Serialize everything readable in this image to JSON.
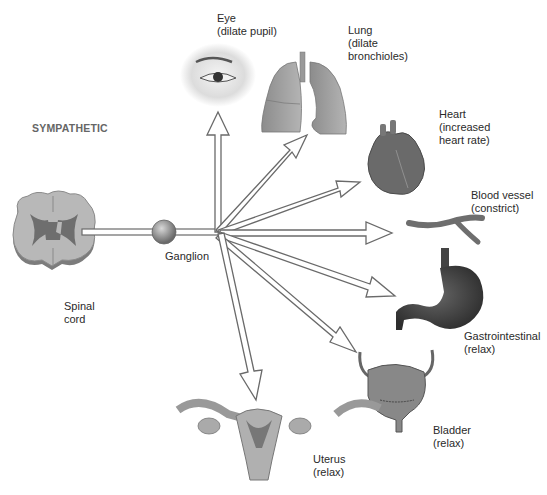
{
  "title": "SYMPATHETIC",
  "source": {
    "label": "Spinal\ncord"
  },
  "ganglion": {
    "label": "Ganglion"
  },
  "targets": [
    {
      "organ": "Eye",
      "effect": "(dilate pupil)",
      "label": "Eye\n(dilate pupil)"
    },
    {
      "organ": "Lung",
      "effect": "(dilate bronchioles)",
      "label": "Lung\n(dilate\nbronchioles)"
    },
    {
      "organ": "Heart",
      "effect": "(increased heart rate)",
      "label": "Heart\n(increased\nheart rate)"
    },
    {
      "organ": "Blood vessel",
      "effect": "(constrict)",
      "label": "Blood vessel\n(constrict)"
    },
    {
      "organ": "Gastrointestinal",
      "effect": "(relax)",
      "label": "Gastrointestinal\n(relax)"
    },
    {
      "organ": "Bladder",
      "effect": "(relax)",
      "label": "Bladder\n(relax)"
    },
    {
      "organ": "Uterus",
      "effect": "(relax)",
      "label": "Uterus\n(relax)"
    }
  ],
  "colors": {
    "organ_fill": "#8a8a8a",
    "organ_dark": "#5a5a5a",
    "arrow_outline": "#707070",
    "text": "#2a2a2a",
    "title": "#666666"
  }
}
